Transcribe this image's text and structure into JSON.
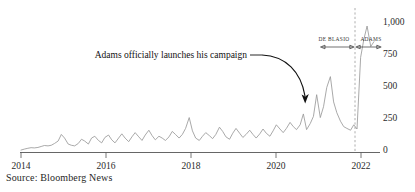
{
  "chart_data": {
    "type": "line",
    "title": "",
    "subtitle": "",
    "xlabel": "",
    "ylabel": "",
    "xlim": [
      2014.0,
      2022.9
    ],
    "ylim": [
      0,
      1100
    ],
    "grid": false,
    "legend_position": "none",
    "x_ticks": [
      "2014",
      "2016",
      "2018",
      "2020",
      "2022"
    ],
    "x_tick_values": [
      2014,
      2016,
      2018,
      2020,
      2022
    ],
    "y_ticks": [
      "0",
      "250",
      "500",
      "750",
      "1,000"
    ],
    "y_tick_values": [
      0,
      250,
      500,
      750,
      1000
    ],
    "series": [
      {
        "name": "Mentions",
        "color": "#9a9a9a",
        "x": [
          2014.0,
          2014.08,
          2014.17,
          2014.25,
          2014.33,
          2014.42,
          2014.5,
          2014.58,
          2014.67,
          2014.75,
          2014.83,
          2014.92,
          2015.0,
          2015.08,
          2015.17,
          2015.25,
          2015.33,
          2015.42,
          2015.5,
          2015.58,
          2015.67,
          2015.75,
          2015.83,
          2015.92,
          2016.0,
          2016.08,
          2016.17,
          2016.25,
          2016.33,
          2016.42,
          2016.5,
          2016.58,
          2016.67,
          2016.75,
          2016.83,
          2016.92,
          2017.0,
          2017.08,
          2017.17,
          2017.25,
          2017.33,
          2017.42,
          2017.5,
          2017.58,
          2017.67,
          2017.75,
          2017.83,
          2017.92,
          2018.0,
          2018.08,
          2018.17,
          2018.25,
          2018.33,
          2018.42,
          2018.5,
          2018.58,
          2018.67,
          2018.75,
          2018.83,
          2018.92,
          2019.0,
          2019.08,
          2019.17,
          2019.25,
          2019.33,
          2019.42,
          2019.5,
          2019.58,
          2019.67,
          2019.75,
          2019.83,
          2019.92,
          2020.0,
          2020.08,
          2020.17,
          2020.25,
          2020.33,
          2020.42,
          2020.5,
          2020.58,
          2020.67,
          2020.75,
          2020.83,
          2020.92,
          2021.0,
          2021.08,
          2021.17,
          2021.25,
          2021.33,
          2021.42,
          2021.5,
          2021.58,
          2021.67,
          2021.75,
          2021.83,
          2021.92,
          2022.0,
          2022.08,
          2022.17,
          2022.25,
          2022.33,
          2022.42,
          2022.5,
          2022.58,
          2022.67,
          2022.75
        ],
        "values": [
          20,
          28,
          35,
          40,
          38,
          42,
          50,
          58,
          55,
          60,
          75,
          95,
          150,
          120,
          70,
          60,
          55,
          75,
          110,
          95,
          70,
          120,
          135,
          100,
          80,
          125,
          145,
          105,
          80,
          120,
          155,
          120,
          90,
          130,
          165,
          130,
          100,
          145,
          185,
          140,
          105,
          135,
          120,
          100,
          130,
          175,
          150,
          120,
          150,
          200,
          290,
          180,
          120,
          100,
          135,
          165,
          140,
          115,
          150,
          210,
          175,
          130,
          110,
          160,
          200,
          160,
          125,
          150,
          185,
          150,
          120,
          155,
          195,
          160,
          135,
          180,
          230,
          195,
          165,
          200,
          250,
          215,
          190,
          230,
          320,
          190,
          240,
          300,
          480,
          290,
          380,
          540,
          630,
          420,
          330,
          260,
          215,
          200,
          185,
          230,
          195,
          790,
          940,
          1050,
          880,
          920
        ]
      }
    ],
    "annotations": [
      {
        "name": "campaign-launch",
        "text": "Adams officially launches his campaign",
        "target_x": 2020.9,
        "target_y": 330
      },
      {
        "name": "era-de-blasio",
        "text": "DE BLASIO",
        "range": [
          2021.1,
          2021.95
        ]
      },
      {
        "name": "era-adams",
        "text": "ADAMS",
        "range": [
          2022.0,
          2022.8
        ]
      }
    ],
    "reference_line": {
      "name": "mayoral-transition",
      "x": 2022.0,
      "style": "dashed"
    }
  },
  "footer": {
    "source": "Source: Bloomberg News"
  }
}
